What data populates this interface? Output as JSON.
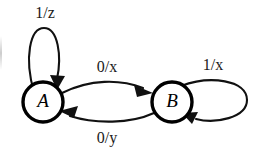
{
  "diagram": {
    "background_color": "#ffffff",
    "ink_color": "#111111",
    "states": [
      {
        "id": "A",
        "label": "A",
        "cx": 43,
        "cy": 102,
        "r": 20
      },
      {
        "id": "B",
        "label": "B",
        "cx": 172,
        "cy": 102,
        "r": 20
      }
    ],
    "transitions": [
      {
        "id": "a-self",
        "from": "A",
        "to": "A",
        "input": "1",
        "output": "z",
        "label": "1/z",
        "label_x": 45,
        "label_y": 14,
        "kind": "self-loop-top"
      },
      {
        "id": "a-to-b",
        "from": "A",
        "to": "B",
        "input": "0",
        "output": "x",
        "label": "0/x",
        "label_x": 107,
        "label_y": 68,
        "kind": "arc-upper"
      },
      {
        "id": "b-self",
        "from": "B",
        "to": "B",
        "input": "1",
        "output": "x",
        "label": "1/x",
        "label_x": 213,
        "label_y": 66,
        "kind": "self-loop-right"
      },
      {
        "id": "b-to-a",
        "from": "B",
        "to": "A",
        "input": "0",
        "output": "y",
        "label": "0/y",
        "label_x": 107,
        "label_y": 139,
        "kind": "arc-lower"
      }
    ]
  }
}
